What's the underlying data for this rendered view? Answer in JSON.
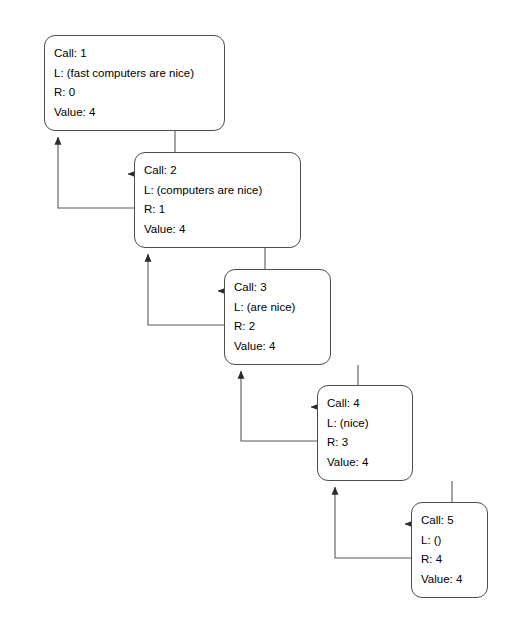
{
  "diagram": {
    "labels": {
      "call_prefix": "Call:",
      "list_prefix": "L:",
      "result_prefix": "R:",
      "value_prefix": "Value:"
    },
    "colors": {
      "box_border": "#4d4d4d",
      "box_fill": "#ffffff",
      "edge": "#595959",
      "text": "#000000"
    },
    "nodes": [
      {
        "id": "call-1",
        "call": "Call: 1",
        "list": "L: (fast computers are nice)",
        "result": "R: 0",
        "value": "Value: 4",
        "x": 44,
        "y": 35,
        "w": 181,
        "h": 96
      },
      {
        "id": "call-2",
        "call": "Call: 2",
        "list": "L: (computers are nice)",
        "result": "R: 1",
        "value": "Value: 4",
        "x": 134,
        "y": 152,
        "w": 167,
        "h": 96
      },
      {
        "id": "call-3",
        "call": "Call: 3",
        "list": "L: (are nice)",
        "result": "R: 2",
        "value": "Value: 4",
        "x": 224,
        "y": 269,
        "w": 107,
        "h": 96
      },
      {
        "id": "call-4",
        "call": "Call: 4",
        "list": "L: (nice)",
        "result": "R: 3",
        "value": "Value: 4",
        "x": 317,
        "y": 385,
        "w": 96,
        "h": 96
      },
      {
        "id": "call-5",
        "call": "Call: 5",
        "list": "L: ()",
        "result": "R: 4",
        "value": "Value: 4",
        "x": 411,
        "y": 502,
        "w": 77,
        "h": 96
      }
    ],
    "edges": [
      {
        "id": "edge-call-1-to-2",
        "kind": "descend",
        "from": "call-1",
        "to": "call-2"
      },
      {
        "id": "edge-return-2-to-1",
        "kind": "return",
        "from": "call-2",
        "to": "call-1"
      },
      {
        "id": "edge-call-2-to-3",
        "kind": "descend",
        "from": "call-2",
        "to": "call-3"
      },
      {
        "id": "edge-return-3-to-2",
        "kind": "return",
        "from": "call-3",
        "to": "call-2"
      },
      {
        "id": "edge-call-3-to-4",
        "kind": "descend",
        "from": "call-3",
        "to": "call-4"
      },
      {
        "id": "edge-return-4-to-3",
        "kind": "return",
        "from": "call-4",
        "to": "call-3"
      },
      {
        "id": "edge-call-4-to-5",
        "kind": "descend",
        "from": "call-4",
        "to": "call-5"
      },
      {
        "id": "edge-return-5-to-4",
        "kind": "return",
        "from": "call-5",
        "to": "call-4"
      }
    ]
  }
}
